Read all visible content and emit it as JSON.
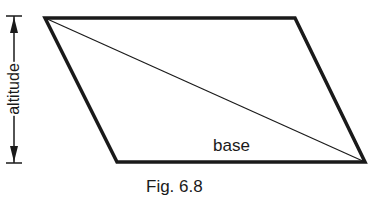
{
  "diagram": {
    "type": "parallelogram",
    "vertices": {
      "top_left": [
        45,
        18
      ],
      "top_right": [
        295,
        18
      ],
      "bottom_right": [
        365,
        162
      ],
      "bottom_left": [
        117,
        162
      ]
    },
    "diagonal": {
      "from": "top_left",
      "to": "bottom_right"
    },
    "colors": {
      "stroke": "#1a1a1a",
      "background": "#ffffff"
    }
  },
  "labels": {
    "altitude": "altitude",
    "base": "base",
    "caption": "Fig. 6.8"
  }
}
